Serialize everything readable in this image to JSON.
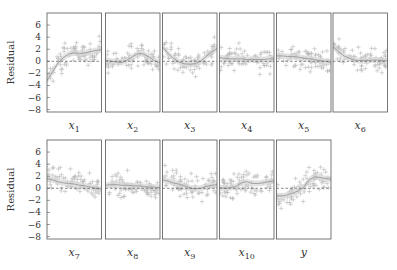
{
  "chart_data": {
    "type": "scatter",
    "title": "",
    "ylabel": "Residual",
    "ylim": [
      -8.4,
      8.0
    ],
    "yticks": [
      6,
      4,
      2,
      0,
      -2,
      -4,
      -6,
      -8
    ],
    "ytick_labels": [
      "6",
      "4",
      "2",
      "0",
      "−2",
      "−4",
      "−6",
      "−8"
    ],
    "grid": false,
    "reference_line": {
      "y": 0,
      "style": "dashed"
    },
    "colors": {
      "points": "#b8b8b8",
      "smooth_band": "#d6d6d6",
      "smooth_line": "#a0a0a0",
      "frame": "#555555",
      "zero_line": "#555555"
    },
    "panels": [
      {
        "label": "x",
        "sub": "1",
        "row": 0,
        "col": 0,
        "smooth": [
          [
            0,
            -3.2
          ],
          [
            0.1,
            -1.8
          ],
          [
            0.2,
            -0.3
          ],
          [
            0.3,
            0.6
          ],
          [
            0.4,
            1.2
          ],
          [
            0.5,
            1.4
          ],
          [
            0.6,
            1.3
          ],
          [
            0.7,
            1.4
          ],
          [
            0.8,
            1.6
          ],
          [
            0.9,
            1.8
          ],
          [
            1,
            1.9
          ]
        ]
      },
      {
        "label": "x",
        "sub": "2",
        "row": 0,
        "col": 1,
        "smooth": [
          [
            0,
            0.2
          ],
          [
            0.1,
            0.0
          ],
          [
            0.2,
            -0.1
          ],
          [
            0.3,
            -0.2
          ],
          [
            0.4,
            0.2
          ],
          [
            0.5,
            0.8
          ],
          [
            0.6,
            1.3
          ],
          [
            0.7,
            1.2
          ],
          [
            0.8,
            0.7
          ],
          [
            0.9,
            0.1
          ],
          [
            1,
            -0.3
          ]
        ]
      },
      {
        "label": "x",
        "sub": "3",
        "row": 0,
        "col": 2,
        "smooth": [
          [
            0,
            2.4
          ],
          [
            0.1,
            1.3
          ],
          [
            0.2,
            0.5
          ],
          [
            0.3,
            -0.1
          ],
          [
            0.4,
            -0.4
          ],
          [
            0.5,
            -0.5
          ],
          [
            0.6,
            -0.4
          ],
          [
            0.7,
            0.0
          ],
          [
            0.8,
            0.8
          ],
          [
            0.9,
            1.6
          ],
          [
            1,
            2.1
          ]
        ]
      },
      {
        "label": "x",
        "sub": "4",
        "row": 0,
        "col": 3,
        "smooth": [
          [
            0,
            0.6
          ],
          [
            0.1,
            0.5
          ],
          [
            0.2,
            0.4
          ],
          [
            0.3,
            0.4
          ],
          [
            0.4,
            0.4
          ],
          [
            0.5,
            0.3
          ],
          [
            0.6,
            0.3
          ],
          [
            0.7,
            0.3
          ],
          [
            0.8,
            0.3
          ],
          [
            0.9,
            0.4
          ],
          [
            1,
            0.4
          ]
        ]
      },
      {
        "label": "x",
        "sub": "5",
        "row": 0,
        "col": 4,
        "smooth": [
          [
            0,
            0.9
          ],
          [
            0.1,
            0.9
          ],
          [
            0.2,
            0.8
          ],
          [
            0.3,
            0.8
          ],
          [
            0.4,
            0.7
          ],
          [
            0.5,
            0.5
          ],
          [
            0.6,
            0.4
          ],
          [
            0.7,
            0.3
          ],
          [
            0.8,
            0.1
          ],
          [
            0.9,
            0.0
          ],
          [
            1,
            -0.2
          ]
        ]
      },
      {
        "label": "x",
        "sub": "6",
        "row": 0,
        "col": 5,
        "smooth": [
          [
            0,
            2.4
          ],
          [
            0.1,
            1.6
          ],
          [
            0.2,
            0.9
          ],
          [
            0.3,
            0.5
          ],
          [
            0.4,
            0.2
          ],
          [
            0.5,
            0.1
          ],
          [
            0.6,
            0.1
          ],
          [
            0.7,
            0.2
          ],
          [
            0.8,
            0.2
          ],
          [
            0.9,
            0.1
          ],
          [
            1,
            0.1
          ]
        ]
      },
      {
        "label": "x",
        "sub": "7",
        "row": 1,
        "col": 0,
        "smooth": [
          [
            0,
            1.6
          ],
          [
            0.1,
            1.4
          ],
          [
            0.2,
            1.1
          ],
          [
            0.3,
            0.9
          ],
          [
            0.4,
            0.8
          ],
          [
            0.5,
            0.7
          ],
          [
            0.6,
            0.5
          ],
          [
            0.7,
            0.4
          ],
          [
            0.8,
            0.2
          ],
          [
            0.9,
            0.0
          ],
          [
            1,
            -0.1
          ]
        ]
      },
      {
        "label": "x",
        "sub": "8",
        "row": 1,
        "col": 1,
        "smooth": [
          [
            0,
            0.5
          ],
          [
            0.1,
            0.6
          ],
          [
            0.2,
            0.6
          ],
          [
            0.3,
            0.5
          ],
          [
            0.4,
            0.5
          ],
          [
            0.5,
            0.4
          ],
          [
            0.6,
            0.4
          ],
          [
            0.7,
            0.3
          ],
          [
            0.8,
            0.2
          ],
          [
            0.9,
            0.2
          ],
          [
            1,
            0.1
          ]
        ]
      },
      {
        "label": "x",
        "sub": "9",
        "row": 1,
        "col": 2,
        "smooth": [
          [
            0,
            1.4
          ],
          [
            0.1,
            1.2
          ],
          [
            0.2,
            0.9
          ],
          [
            0.3,
            0.7
          ],
          [
            0.4,
            0.4
          ],
          [
            0.5,
            0.1
          ],
          [
            0.6,
            -0.1
          ],
          [
            0.7,
            0.0
          ],
          [
            0.8,
            0.3
          ],
          [
            0.9,
            0.5
          ],
          [
            1,
            0.6
          ]
        ]
      },
      {
        "label": "x",
        "sub": "10",
        "row": 1,
        "col": 3,
        "smooth": [
          [
            0,
            0.1
          ],
          [
            0.1,
            0.0
          ],
          [
            0.2,
            0.1
          ],
          [
            0.3,
            0.3
          ],
          [
            0.4,
            0.9
          ],
          [
            0.5,
            1.1
          ],
          [
            0.6,
            0.8
          ],
          [
            0.7,
            0.8
          ],
          [
            0.8,
            0.9
          ],
          [
            0.9,
            1.1
          ],
          [
            1,
            1.2
          ]
        ]
      },
      {
        "label": "y",
        "sub": "",
        "row": 1,
        "col": 4,
        "smooth": [
          [
            0,
            -1.2
          ],
          [
            0.1,
            -1.3
          ],
          [
            0.2,
            -1.1
          ],
          [
            0.3,
            -0.8
          ],
          [
            0.4,
            -0.4
          ],
          [
            0.5,
            0.2
          ],
          [
            0.6,
            1.4
          ],
          [
            0.7,
            1.9
          ],
          [
            0.8,
            1.8
          ],
          [
            0.9,
            1.6
          ],
          [
            1,
            1.5
          ]
        ]
      }
    ],
    "points_per_panel": 80,
    "points_note": "scatter of residuals roughly uniform in x over [0,1], residual spread ~[-8,8], concentrated near the smooth curve"
  }
}
